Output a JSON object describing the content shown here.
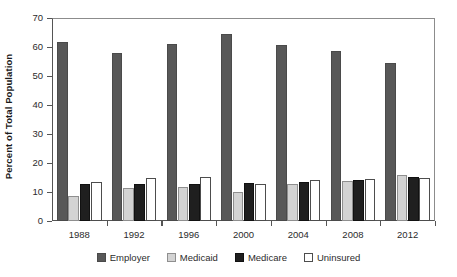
{
  "chart_data": {
    "type": "bar",
    "title": "",
    "subtitle": "",
    "xlabel": "",
    "ylabel": "Percent of Total Population",
    "categories": [
      "1988",
      "1992",
      "1996",
      "2000",
      "2004",
      "2008",
      "2012"
    ],
    "series": [
      {
        "name": "Employer",
        "color": "#585858",
        "values": [
          61.9,
          57.8,
          61.2,
          64.6,
          60.6,
          58.6,
          54.5
        ]
      },
      {
        "name": "Medicaid",
        "color": "#d3d3d3",
        "values": [
          8.6,
          11.3,
          11.8,
          9.9,
          12.6,
          13.8,
          16.0
        ]
      },
      {
        "name": "Medicare",
        "color": "#1f1f1f",
        "values": [
          12.6,
          12.6,
          12.9,
          13.2,
          13.4,
          14.0,
          15.3
        ]
      },
      {
        "name": "Uninsured",
        "color": "#ffffff",
        "values": [
          13.3,
          14.8,
          15.2,
          12.6,
          14.0,
          14.4,
          15.0
        ]
      }
    ],
    "ylim": [
      0,
      70
    ],
    "yticks": [
      0,
      10,
      20,
      30,
      40,
      50,
      60,
      70
    ],
    "ytick_labels": [
      "0",
      "10",
      "20",
      "30",
      "40",
      "50",
      "60",
      "70"
    ],
    "grid": false,
    "legend_position": "bottom",
    "legend_entries": [
      "Employer",
      "Medicaid",
      "Medicare",
      "Uninsured"
    ]
  }
}
